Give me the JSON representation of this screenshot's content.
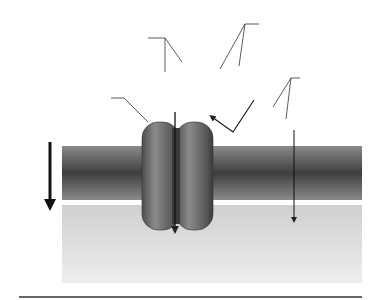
{
  "figure": {
    "labels": {
      "specific_line1": "Specific",
      "specific_line2": "non-lipid-soluble",
      "specific_line3": "molecules or ions",
      "nonlipid_line1": "Non-lipid-soluble",
      "nonlipid_line2": "molecules",
      "lipid_line1": "Lipid-soluble",
      "lipid_line2": "molecules",
      "channel_line1": "Membrane",
      "channel_line2": "channel",
      "gradient_line1": "Concentration",
      "gradient_line2": "gradient"
    },
    "colors": {
      "background_lower": "#d6d6d6",
      "membrane_dark": "#4a4a4a",
      "lipid_head": "#9a9a9a",
      "channel": "#6a6a6a",
      "leader_line": "#333333",
      "rule": "#666666"
    },
    "particles": {
      "ions_above": [
        [
          162,
          74
        ],
        [
          182,
          64
        ],
        [
          160,
          87
        ],
        [
          174,
          94
        ],
        [
          188,
          86
        ],
        [
          160,
          100
        ],
        [
          190,
          99
        ],
        [
          174,
          107
        ]
      ],
      "ions_below": [
        [
          163,
          231
        ],
        [
          188,
          232
        ],
        [
          165,
          251
        ]
      ],
      "nonlipid": [
        [
          218,
          72
        ],
        [
          239,
          69
        ],
        [
          259,
          58
        ],
        [
          278,
          52
        ],
        [
          233,
          88
        ],
        [
          255,
          79
        ],
        [
          274,
          75
        ]
      ],
      "lipid_above": [
        [
          271,
          110
        ],
        [
          286,
          108
        ],
        [
          303,
          101
        ],
        [
          328,
          117
        ],
        [
          287,
          124
        ],
        [
          305,
          126
        ]
      ],
      "lipid_below": [
        [
          280,
          228
        ],
        [
          298,
          238
        ],
        [
          317,
          228
        ],
        [
          334,
          234
        ]
      ]
    }
  }
}
